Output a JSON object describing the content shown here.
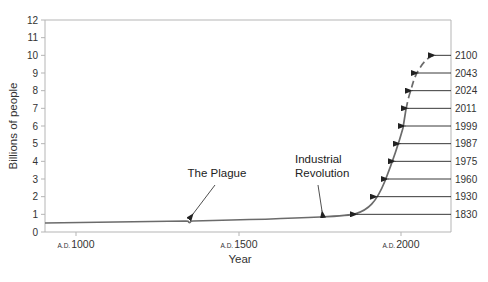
{
  "chart_data": {
    "type": "line",
    "title": "",
    "xlabel": "Year",
    "ylabel": "Billions of people",
    "ylim": [
      0,
      12
    ],
    "xlim": [
      905,
      2155
    ],
    "grid": false,
    "y_ticks": [
      "0",
      "1",
      "2",
      "3",
      "4",
      "5",
      "6",
      "7",
      "8",
      "9",
      "10",
      "11",
      "12"
    ],
    "x_ticks": [
      {
        "prefix": "A.D.",
        "year": "1000"
      },
      {
        "prefix": "A.D.",
        "year": "1500"
      },
      {
        "prefix": "A.D.",
        "year": "2000"
      }
    ],
    "series": [
      {
        "name": "World population (historical)",
        "style": "solid",
        "x": [
          905,
          1000,
          1100,
          1200,
          1300,
          1340,
          1350,
          1360,
          1400,
          1500,
          1600,
          1700,
          1750,
          1800,
          1830,
          1900,
          1930,
          1960,
          1975,
          1987,
          1999,
          2011
        ],
        "values": [
          0.5,
          0.51,
          0.54,
          0.57,
          0.6,
          0.6,
          0.5,
          0.6,
          0.62,
          0.65,
          0.7,
          0.76,
          0.8,
          0.88,
          1.0,
          1.6,
          2.0,
          3.0,
          4.0,
          5.0,
          6.0,
          7.0
        ]
      },
      {
        "name": "World population (projected)",
        "style": "dashed",
        "x": [
          2011,
          2024,
          2043,
          2070,
          2100
        ],
        "values": [
          7.0,
          8.0,
          9.0,
          9.6,
          9.9
        ]
      }
    ],
    "annotations": [
      {
        "text": "The Plague",
        "x": 1350,
        "y": 0.5
      },
      {
        "text": "Industrial Revolution",
        "line1": "Industrial",
        "line2": "Revolution",
        "x": 1750,
        "y": 0.8
      }
    ],
    "milestones": [
      {
        "year": "1830",
        "billions": 1
      },
      {
        "year": "1930",
        "billions": 2
      },
      {
        "year": "1960",
        "billions": 3
      },
      {
        "year": "1975",
        "billions": 4
      },
      {
        "year": "1987",
        "billions": 5
      },
      {
        "year": "1999",
        "billions": 6
      },
      {
        "year": "2011",
        "billions": 7
      },
      {
        "year": "2024",
        "billions": 8
      },
      {
        "year": "2043",
        "billions": 9
      },
      {
        "year": "2100",
        "billions": 10
      }
    ]
  },
  "colors": {
    "curve": "#6b6b6b",
    "axis": "#b5b5b5",
    "arrow": "#222222",
    "text": "#333333"
  }
}
